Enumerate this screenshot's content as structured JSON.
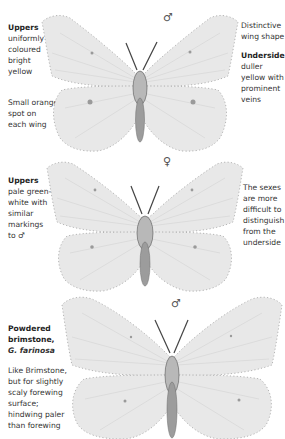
{
  "plates": [
    {
      "id": "brimstone-male",
      "sex_symbol": "♂",
      "left_notes": [
        {
          "heading": "Uppers",
          "lines": [
            "uniformly",
            "coloured",
            "bright",
            "yellow"
          ]
        },
        {
          "heading": "",
          "lines": [
            "Small orange",
            "spot on",
            "each wing"
          ]
        }
      ],
      "right_notes": [
        {
          "heading": "",
          "lines": [
            "Distinctive",
            "wing shape"
          ]
        },
        {
          "heading": "Underside",
          "lines": [
            "duller",
            "yellow with",
            "prominent",
            "veins"
          ]
        }
      ]
    },
    {
      "id": "brimstone-female",
      "sex_symbol": "♀",
      "left_notes": [
        {
          "heading": "Uppers",
          "lines": [
            "pale green-",
            "white with",
            "similar",
            "markings",
            "to ♂"
          ]
        }
      ],
      "right_notes": [
        {
          "heading": "",
          "lines": [
            "The sexes",
            "are more",
            "difficult to",
            "distinguish",
            "from the",
            "underside"
          ]
        }
      ]
    },
    {
      "id": "powdered-brimstone-male",
      "sex_symbol": "♂",
      "left_notes": [
        {
          "heading_lines": [
            "Powdered",
            "brimstone,"
          ],
          "heading_italic": "G. farinosa"
        },
        {
          "heading": "",
          "lines": [
            "Like Brimstone,",
            "but for slightly",
            "scaly forewing",
            "surface;",
            "hindwing paler",
            "than forewing"
          ]
        }
      ]
    }
  ],
  "colors": {
    "background": "#ffffff",
    "wing": "#e8e8e8",
    "text": "#333333"
  }
}
